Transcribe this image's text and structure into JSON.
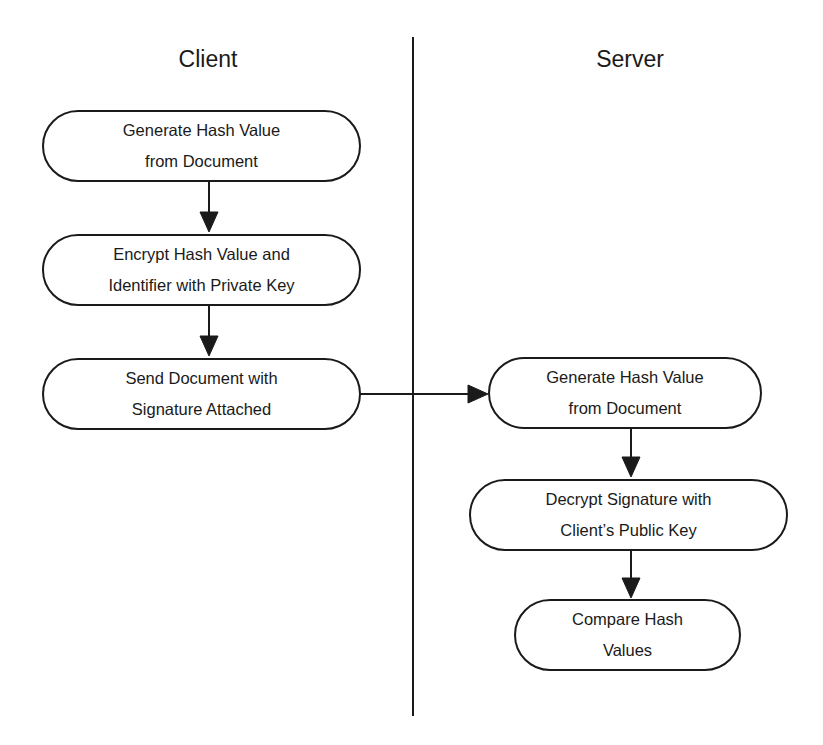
{
  "lanes": {
    "client": {
      "title": "Client"
    },
    "server": {
      "title": "Server"
    }
  },
  "client_steps": [
    {
      "label": "Generate Hash Value\nfrom Document"
    },
    {
      "label": "Encrypt Hash Value and\nIdentifier with Private Key"
    },
    {
      "label": "Send Document with\nSignature Attached"
    }
  ],
  "server_steps": [
    {
      "label": "Generate Hash Value\nfrom Document"
    },
    {
      "label": "Decrypt Signature with\nClient’s Public Key"
    },
    {
      "label": "Compare Hash\nValues"
    }
  ],
  "colors": {
    "line": "#1a1a1a",
    "background": "#ffffff"
  }
}
